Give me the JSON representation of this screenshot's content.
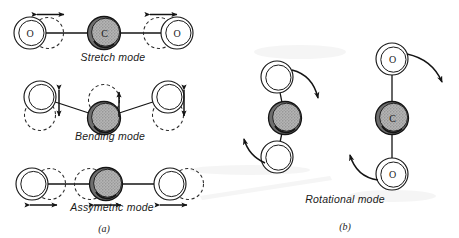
{
  "figure": {
    "background_color": "#ffffff",
    "ink_color": "#1a1a1a",
    "carbon_fill_color": "#a8a8a8",
    "oxygen_fill_color": "#ffffff"
  },
  "panels": [
    {
      "id": "a",
      "caption": "(a)",
      "description": "Vibrational modes",
      "modes": [
        {
          "id": "stretch",
          "caption": "Stretch mode",
          "atoms": [
            {
              "element": "O",
              "label": "O",
              "position": "left"
            },
            {
              "element": "C",
              "label": "C",
              "position": "center"
            },
            {
              "element": "O",
              "label": "O",
              "position": "right"
            }
          ],
          "displacement": "symmetric-horizontal",
          "arrows": [
            "double-headed-horizontal-left",
            "double-headed-horizontal-right"
          ]
        },
        {
          "id": "bending",
          "caption": "Bending mode",
          "atoms": [
            {
              "element": "O",
              "label": "",
              "position": "left"
            },
            {
              "element": "C",
              "label": "",
              "position": "center"
            },
            {
              "element": "O",
              "label": "",
              "position": "right"
            }
          ],
          "displacement": "transverse-vertical",
          "arrows": [
            "double-headed-vertical-left",
            "single-headed-vertical-center",
            "double-headed-vertical-right"
          ]
        },
        {
          "id": "assymetric",
          "caption": "Assymetric mode",
          "atoms": [
            {
              "element": "O",
              "label": "",
              "position": "left"
            },
            {
              "element": "C",
              "label": "",
              "position": "center"
            },
            {
              "element": "O",
              "label": "",
              "position": "right"
            }
          ],
          "displacement": "asymmetric-horizontal",
          "arrows": [
            "double-headed-horizontal-left",
            "double-headed-horizontal-center",
            "double-headed-horizontal-right"
          ]
        }
      ]
    },
    {
      "id": "b",
      "caption": "(b)",
      "description": "Rotational mode",
      "modes": [
        {
          "id": "rotational",
          "caption": "Rotational mode",
          "molecules": [
            {
              "id": "rotated",
              "orientation": "tilted",
              "atoms": [
                {
                  "element": "O",
                  "label": "",
                  "position": "top"
                },
                {
                  "element": "C",
                  "label": "",
                  "position": "center"
                },
                {
                  "element": "O",
                  "label": "",
                  "position": "bottom"
                }
              ]
            },
            {
              "id": "upright",
              "orientation": "vertical",
              "atoms": [
                {
                  "element": "O",
                  "label": "O",
                  "position": "top"
                },
                {
                  "element": "C",
                  "label": "C",
                  "position": "center"
                },
                {
                  "element": "O",
                  "label": "O",
                  "position": "bottom"
                }
              ]
            }
          ],
          "arrows": [
            "curved-clockwise-top",
            "curved-clockwise-bottom"
          ]
        }
      ]
    }
  ]
}
